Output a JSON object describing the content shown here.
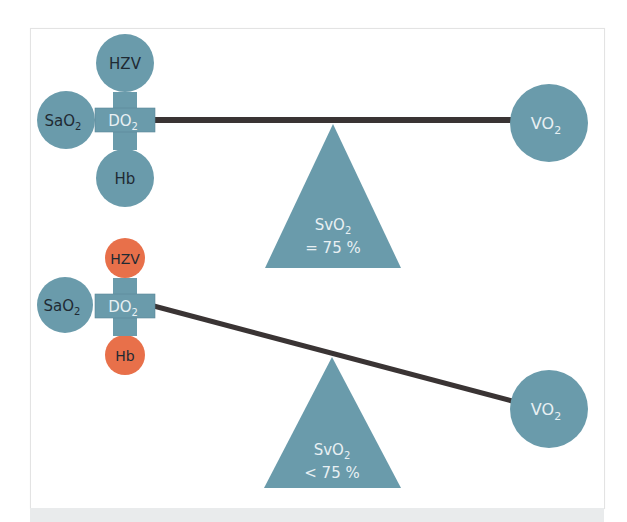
{
  "colors": {
    "teal": "#6a9bab",
    "orange": "#e8704a",
    "beam": "#3a3434",
    "text_dark": "#1f2a33",
    "text_light": "#e8f0f3",
    "frame_border": "#e3e3e3",
    "bottom_band": "#e9ebec"
  },
  "panels": [
    {
      "name": "balanced",
      "inputs": {
        "top": {
          "label": "HZV",
          "color": "teal"
        },
        "left": {
          "label": "SaO",
          "sub": "2",
          "color": "teal"
        },
        "bottom": {
          "label": "Hb",
          "color": "teal"
        }
      },
      "hub": {
        "label": "DO",
        "sub": "2"
      },
      "demand": {
        "label": "VO",
        "sub": "2"
      },
      "fulcrum": {
        "line1": "SvO",
        "line1_sub": "2",
        "line2": "= 75 %"
      },
      "beam_state": "level"
    },
    {
      "name": "imbalanced",
      "inputs": {
        "top": {
          "label": "HZV",
          "color": "orange"
        },
        "left": {
          "label": "SaO",
          "sub": "2",
          "color": "teal"
        },
        "bottom": {
          "label": "Hb",
          "color": "orange"
        }
      },
      "hub": {
        "label": "DO",
        "sub": "2"
      },
      "demand": {
        "label": "VO",
        "sub": "2"
      },
      "fulcrum": {
        "line1": "SvO",
        "line1_sub": "2",
        "line2": "< 75 %"
      },
      "beam_state": "tilted-down-right"
    }
  ]
}
